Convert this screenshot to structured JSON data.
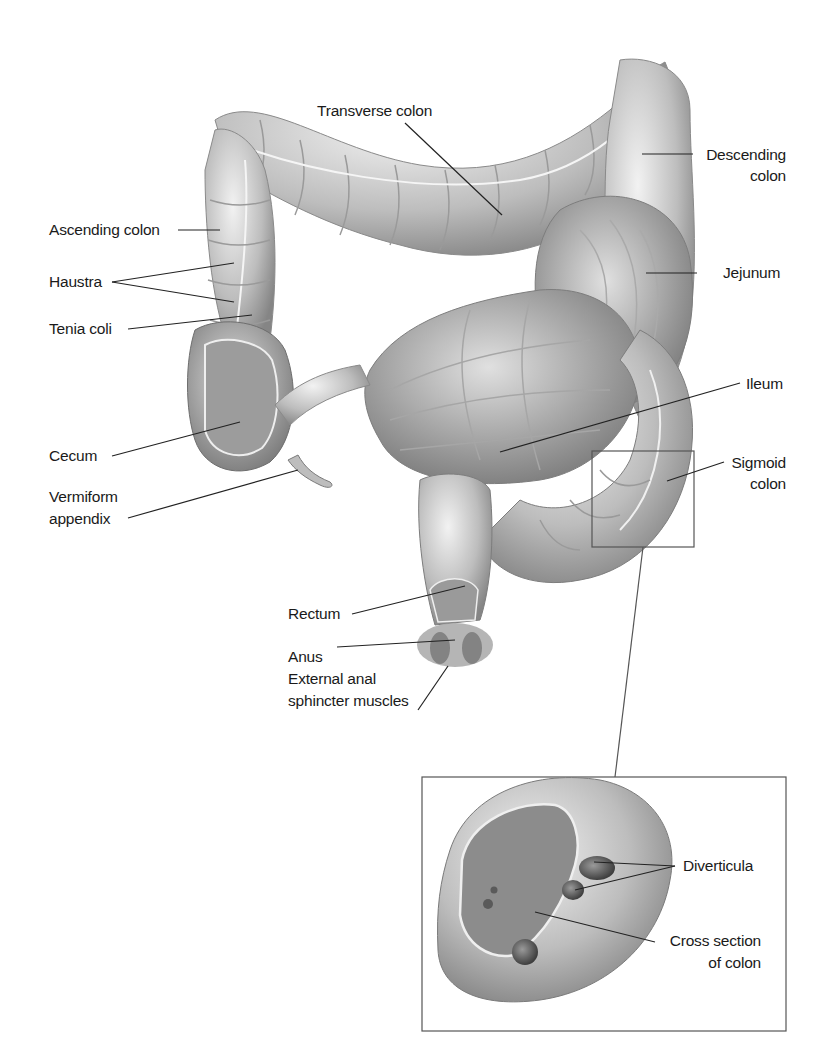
{
  "diagram": {
    "labels": {
      "transverse_colon": "Transverse colon",
      "descending_colon_1": "Descending",
      "descending_colon_2": "colon",
      "ascending_colon": "Ascending colon",
      "haustra": "Haustra",
      "tenia_coli": "Tenia coli",
      "jejunum": "Jejunum",
      "ileum": "Ileum",
      "cecum": "Cecum",
      "sigmoid_colon_1": "Sigmoid",
      "sigmoid_colon_2": "colon",
      "vermiform_appendix_1": "Vermiform",
      "vermiform_appendix_2": "appendix",
      "rectum": "Rectum",
      "anus": "Anus",
      "external_anal_1": "External anal",
      "external_anal_2": "sphincter muscles",
      "diverticula": "Diverticula",
      "cross_section_1": "Cross section",
      "cross_section_2": "of colon"
    },
    "colors": {
      "organ_fill": "#c9c9c9",
      "organ_shadow": "#8e8e8e",
      "organ_highlight": "#ececec",
      "leader_line": "#222222",
      "frame": "#555555"
    }
  }
}
